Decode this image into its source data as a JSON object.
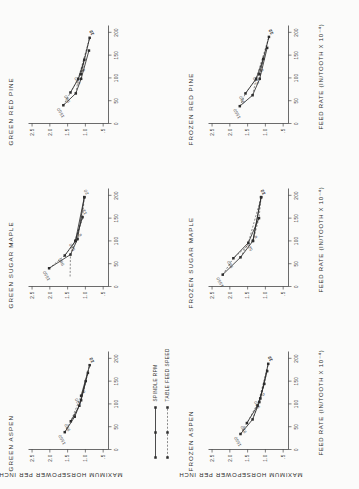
{
  "figure": {
    "axis_x_title": "FEED RATE (IN/TOOTH X 10⁻⁴)",
    "axis_y_title": "MAXIMUM HORSEPOWER PER INCH",
    "legend": {
      "series_solid_label": "SPINDLE  RPM",
      "series_dashed_label": "TABLE FEED SPEED"
    }
  },
  "chart_data": [
    {
      "type": "line",
      "title": "GREEN ASPEN",
      "xlabel": "FEED RATE (IN/TOOTH X 10^-4)",
      "ylabel": "MAXIMUM HORSEPOWER PER INCH",
      "xlim": [
        0,
        215
      ],
      "ylim": [
        0.35,
        2.6
      ],
      "xticks": [
        "0",
        "50",
        "100",
        "150",
        "200"
      ],
      "xtickvals": [
        0,
        50,
        100,
        150,
        200
      ],
      "yticks": [
        ".5",
        "1.0",
        "1.5",
        "2.0",
        "2.5"
      ],
      "ytickvals": [
        0.5,
        1.0,
        1.5,
        2.0,
        2.5
      ],
      "grid": false,
      "legend_position": "top-left",
      "series": [
        {
          "name": "1550",
          "style": "solid",
          "label_anchor": "above-left",
          "points": [
            [
              38,
              1.58
            ],
            [
              72,
              1.3
            ],
            [
              108,
              1.12
            ],
            [
              168,
              0.93
            ]
          ]
        },
        {
          "name": "980",
          "style": "solid",
          "label_anchor": "above-left",
          "points": [
            [
              62,
              1.41
            ],
            [
              96,
              1.17
            ],
            [
              150,
              0.99
            ]
          ]
        },
        {
          "name": "520",
          "style": "solid",
          "label_anchor": "above-left",
          "points": [
            [
              118,
              1.12
            ],
            [
              185,
              0.88
            ]
          ]
        },
        {
          "name": "6",
          "style": "dashed",
          "label_anchor": "below-right",
          "points": [
            [
              38,
              1.58
            ],
            [
              62,
              1.41
            ],
            [
              118,
              1.12
            ]
          ]
        },
        {
          "name": "12",
          "style": "dashed",
          "label_anchor": "below-right",
          "points": [
            [
              72,
              1.3
            ],
            [
              96,
              1.17
            ],
            [
              185,
              0.88
            ]
          ]
        },
        {
          "name": "20",
          "style": "dashed",
          "label_anchor": "below-right",
          "points": [
            [
              108,
              1.12
            ],
            [
              150,
              0.99
            ],
            [
              185,
              0.88
            ]
          ]
        }
      ]
    },
    {
      "type": "line",
      "title": "GREEN SUGAR MAPLE",
      "xlabel": "FEED RATE (IN/TOOTH X 10^-4)",
      "ylabel": "MAXIMUM HORSEPOWER PER INCH",
      "xlim": [
        0,
        215
      ],
      "ylim": [
        0.35,
        2.6
      ],
      "xticks": [
        "0",
        "50",
        "100",
        "150",
        "200"
      ],
      "xtickvals": [
        0,
        50,
        100,
        150,
        200
      ],
      "yticks": [
        ".5",
        "1.0",
        "1.5",
        "2.0",
        "2.5"
      ],
      "ytickvals": [
        0.5,
        1.0,
        1.5,
        2.0,
        2.5
      ],
      "grid": false,
      "legend_position": "none",
      "series": [
        {
          "name": "1550",
          "style": "solid",
          "label_anchor": "above-left",
          "points": [
            [
              40,
              2.02
            ],
            [
              70,
              1.42
            ],
            [
              104,
              1.22
            ],
            [
              196,
              1.03
            ]
          ]
        },
        {
          "name": "980",
          "style": "solid",
          "label_anchor": "above-left",
          "points": [
            [
              68,
              1.58
            ],
            [
              100,
              1.28
            ],
            [
              152,
              1.08
            ]
          ]
        },
        {
          "name": "520",
          "style": "solid",
          "label_anchor": "above-left",
          "points": [
            [
              100,
              1.28
            ],
            [
              196,
              1.03
            ]
          ]
        },
        {
          "name": "6",
          "style": "dashed",
          "label_anchor": "below-right",
          "points": [
            [
              40,
              2.02
            ],
            [
              68,
              1.58
            ],
            [
              104,
              1.22
            ]
          ]
        },
        {
          "name": "12",
          "style": "dashed",
          "label_anchor": "below-right",
          "points": [
            [
              22,
              1.43
            ],
            [
              70,
              1.42
            ],
            [
              152,
              1.08
            ]
          ]
        },
        {
          "name": "20",
          "style": "dashed",
          "label_anchor": "below-right",
          "points": [
            [
              100,
              1.28
            ],
            [
              152,
              1.08
            ],
            [
              196,
              1.03
            ]
          ]
        }
      ]
    },
    {
      "type": "line",
      "title": "GREEN RED PINE",
      "xlabel": "FEED RATE (IN/TOOTH X 10^-4)",
      "ylabel": "MAXIMUM HORSEPOWER PER INCH",
      "xlim": [
        0,
        215
      ],
      "ylim": [
        0.35,
        2.6
      ],
      "xticks": [
        "0",
        "50",
        "100",
        "150",
        "200"
      ],
      "xtickvals": [
        0,
        50,
        100,
        150,
        200
      ],
      "yticks": [
        ".5",
        "1.0",
        "1.5",
        "2.0",
        "2.5"
      ],
      "ytickvals": [
        0.5,
        1.0,
        1.5,
        2.0,
        2.5
      ],
      "grid": false,
      "legend_position": "none",
      "series": [
        {
          "name": "1550",
          "style": "solid",
          "label_anchor": "above-left",
          "points": [
            [
              40,
              1.62
            ],
            [
              66,
              1.27
            ],
            [
              98,
              1.12
            ],
            [
              160,
              0.9
            ]
          ]
        },
        {
          "name": "980",
          "style": "solid",
          "label_anchor": "above-left",
          "points": [
            [
              68,
              1.42
            ],
            [
              98,
              1.2
            ],
            [
              140,
              1.03
            ]
          ]
        },
        {
          "name": "520",
          "style": "solid",
          "label_anchor": "above-left",
          "points": [
            [
              108,
              1.13
            ],
            [
              188,
              0.88
            ]
          ]
        },
        {
          "name": "6",
          "style": "dashed",
          "label_anchor": "below-right",
          "points": [
            [
              40,
              1.62
            ],
            [
              68,
              1.42
            ],
            [
              108,
              1.13
            ]
          ]
        },
        {
          "name": "12",
          "style": "dashed",
          "label_anchor": "below-right",
          "points": [
            [
              66,
              1.27
            ],
            [
              98,
              1.2
            ],
            [
              188,
              0.88
            ]
          ]
        },
        {
          "name": "20",
          "style": "dashed",
          "label_anchor": "below-right",
          "points": [
            [
              98,
              1.12
            ],
            [
              140,
              1.03
            ],
            [
              188,
              0.88
            ]
          ]
        }
      ]
    },
    {
      "type": "line",
      "title": "FROZEN ASPEN",
      "xlabel": "FEED RATE (IN/TOOTH X 10^-4)",
      "ylabel": "MAXIMUM HORSEPOWER PER INCH",
      "xlim": [
        0,
        215
      ],
      "ylim": [
        0.35,
        2.6
      ],
      "xticks": [
        "0",
        "50",
        "100",
        "150",
        "200"
      ],
      "xtickvals": [
        0,
        50,
        100,
        150,
        200
      ],
      "yticks": [
        ".5",
        "1.0",
        "1.5",
        "2.0",
        "2.5"
      ],
      "ytickvals": [
        0.5,
        1.0,
        1.5,
        2.0,
        2.5
      ],
      "grid": false,
      "legend_position": "none",
      "series": [
        {
          "name": "1550",
          "style": "solid",
          "label_anchor": "above-left",
          "points": [
            [
              34,
              1.7
            ],
            [
              66,
              1.36
            ],
            [
              104,
              1.17
            ],
            [
              172,
              0.95
            ]
          ]
        },
        {
          "name": "980",
          "style": "solid",
          "label_anchor": "above-left",
          "points": [
            [
              58,
              1.52
            ],
            [
              96,
              1.22
            ],
            [
              144,
              1.03
            ]
          ]
        },
        {
          "name": "520",
          "style": "solid",
          "label_anchor": "above-left",
          "points": [
            [
              112,
              1.14
            ],
            [
              188,
              0.92
            ]
          ]
        },
        {
          "name": "6",
          "style": "dashed",
          "label_anchor": "below-right",
          "points": [
            [
              34,
              1.7
            ],
            [
              58,
              1.52
            ],
            [
              112,
              1.14
            ]
          ]
        },
        {
          "name": "12",
          "style": "dashed",
          "label_anchor": "below-right",
          "points": [
            [
              66,
              1.36
            ],
            [
              96,
              1.22
            ],
            [
              188,
              0.92
            ]
          ]
        },
        {
          "name": "20",
          "style": "dashed",
          "label_anchor": "below-right",
          "points": [
            [
              104,
              1.17
            ],
            [
              144,
              1.03
            ],
            [
              188,
              0.92
            ]
          ]
        }
      ]
    },
    {
      "type": "line",
      "title": "FROZEN SUGAR MAPLE",
      "xlabel": "FEED RATE (IN/TOOTH X 10^-4)",
      "ylabel": "MAXIMUM HORSEPOWER PER INCH",
      "xlim": [
        0,
        215
      ],
      "ylim": [
        0.35,
        2.6
      ],
      "xticks": [
        "0",
        "50",
        "100",
        "150",
        "200"
      ],
      "xtickvals": [
        0,
        50,
        100,
        150,
        200
      ],
      "yticks": [
        ".5",
        "1.0",
        "1.5",
        "2.0",
        "2.5"
      ],
      "ytickvals": [
        0.5,
        1.0,
        1.5,
        2.0,
        2.5
      ],
      "grid": false,
      "legend_position": "none",
      "series": [
        {
          "name": "1550",
          "style": "solid",
          "label_anchor": "above-left",
          "points": [
            [
              26,
              2.2
            ],
            [
              64,
              1.7
            ],
            [
              100,
              1.35
            ],
            [
              196,
              1.12
            ]
          ]
        },
        {
          "name": "980",
          "style": "solid",
          "label_anchor": "above-left",
          "points": [
            [
              62,
              1.9
            ],
            [
              96,
              1.48
            ],
            [
              150,
              1.18
            ]
          ]
        },
        {
          "name": "520",
          "style": "solid",
          "label_anchor": "above-left",
          "points": [
            [
              100,
              1.35
            ],
            [
              196,
              1.12
            ]
          ]
        },
        {
          "name": "6",
          "style": "dashed",
          "label_anchor": "below-right",
          "points": [
            [
              26,
              2.2
            ],
            [
              62,
              1.9
            ],
            [
              100,
              1.35
            ]
          ]
        },
        {
          "name": "12",
          "style": "dashed",
          "label_anchor": "below-right",
          "points": [
            [
              64,
              1.7
            ],
            [
              96,
              1.48
            ],
            [
              196,
              1.12
            ]
          ]
        },
        {
          "name": "20",
          "style": "dashed",
          "label_anchor": "below-right",
          "points": [
            [
              100,
              1.35
            ],
            [
              150,
              1.18
            ],
            [
              196,
              1.12
            ]
          ]
        }
      ]
    },
    {
      "type": "line",
      "title": "FROZEN RED PINE",
      "xlabel": "FEED RATE (IN/TOOTH X 10^-4)",
      "ylabel": "MAXIMUM HORSEPOWER PER INCH",
      "xlim": [
        0,
        215
      ],
      "ylim": [
        0.35,
        2.6
      ],
      "xticks": [
        "0",
        "50",
        "100",
        "150",
        "200"
      ],
      "xtickvals": [
        0,
        50,
        100,
        150,
        200
      ],
      "yticks": [
        ".5",
        "1.0",
        "1.5",
        "2.0",
        "2.5"
      ],
      "ytickvals": [
        0.5,
        1.0,
        1.5,
        2.0,
        2.5
      ],
      "grid": false,
      "legend_position": "none",
      "series": [
        {
          "name": "1550",
          "style": "solid",
          "label_anchor": "above-left",
          "points": [
            [
              38,
              1.72
            ],
            [
              62,
              1.36
            ],
            [
              98,
              1.16
            ],
            [
              166,
              0.95
            ]
          ]
        },
        {
          "name": "980",
          "style": "solid",
          "label_anchor": "above-left",
          "points": [
            [
              66,
              1.56
            ],
            [
              98,
              1.26
            ],
            [
              142,
              1.06
            ]
          ]
        },
        {
          "name": "520",
          "style": "solid",
          "label_anchor": "above-left",
          "points": [
            [
              108,
              1.17
            ],
            [
              190,
              0.9
            ]
          ]
        },
        {
          "name": "6",
          "style": "dashed",
          "label_anchor": "below-right",
          "points": [
            [
              38,
              1.72
            ],
            [
              66,
              1.56
            ],
            [
              108,
              1.17
            ]
          ]
        },
        {
          "name": "12",
          "style": "dashed",
          "label_anchor": "below-right",
          "points": [
            [
              62,
              1.36
            ],
            [
              98,
              1.26
            ],
            [
              190,
              0.9
            ]
          ]
        },
        {
          "name": "20",
          "style": "dashed",
          "label_anchor": "below-right",
          "points": [
            [
              98,
              1.16
            ],
            [
              142,
              1.06
            ],
            [
              190,
              0.9
            ]
          ]
        }
      ]
    }
  ]
}
